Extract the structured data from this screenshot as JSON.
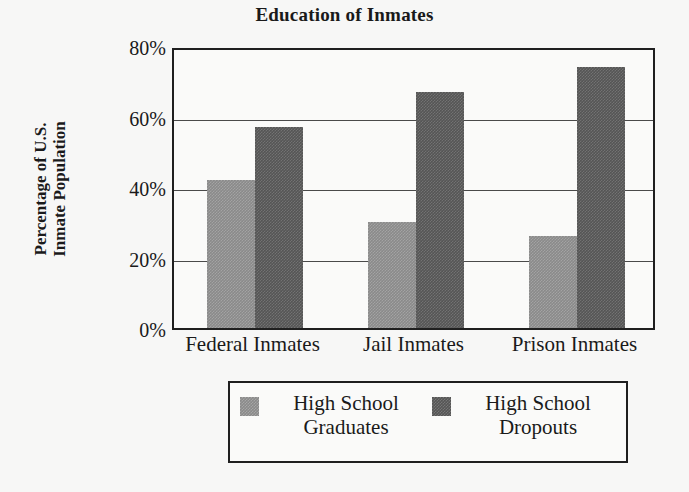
{
  "chart_data": {
    "type": "bar",
    "title": "Education of Inmates",
    "xlabel": "",
    "ylabel": "Percentage of U.S. Inmate Population",
    "ylabel_lines": [
      "Percentage of U.S.",
      "Inmate Population"
    ],
    "categories": [
      "Federal Inmates",
      "Jail Inmates",
      "Prison Inmates"
    ],
    "series": [
      {
        "name": "High School Graduates",
        "name_lines": [
          "High School",
          "Graduates"
        ],
        "color": "#8a8a8a",
        "values": [
          42,
          30,
          26
        ]
      },
      {
        "name": "High School Dropouts",
        "name_lines": [
          "High School",
          "Dropouts"
        ],
        "color": "#555555",
        "values": [
          57,
          67,
          74
        ]
      }
    ],
    "ylim": [
      0,
      80
    ],
    "ytick_values": [
      0,
      20,
      40,
      60,
      80
    ],
    "ytick_labels": [
      "0%",
      "20%",
      "40%",
      "60%",
      "80%"
    ],
    "grid": true,
    "legend_position": "bottom",
    "background_color": "#f7f7f6",
    "axis_color": "#1f1f1f"
  }
}
